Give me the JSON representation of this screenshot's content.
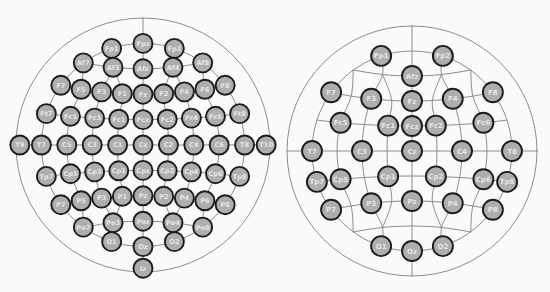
{
  "figure": {
    "background": "#fafaf9",
    "line_color": "#8c8c8c",
    "line_width": 1,
    "electrode_fill": "#aeaeae",
    "electrode_stroke": "#1c1c1c",
    "electrode_stroke_width": 1.9,
    "label_color": "#e6e6e6"
  },
  "positions": {
    "Fpz": [
      0,
      -0.8
    ],
    "Fp1": [
      -0.247,
      -0.761
    ],
    "Fp2": [
      0.247,
      -0.761
    ],
    "Af7": [
      -0.47,
      -0.647
    ],
    "Af3": [
      -0.236,
      -0.612
    ],
    "Afz": [
      0,
      -0.6
    ],
    "Af4": [
      0.236,
      -0.612
    ],
    "Af8": [
      0.47,
      -0.647
    ],
    "F7": [
      -0.647,
      -0.47
    ],
    "F5": [
      -0.487,
      -0.439
    ],
    "F3": [
      -0.326,
      -0.418
    ],
    "F1": [
      -0.163,
      -0.404
    ],
    "Fz": [
      0,
      -0.4
    ],
    "F2": [
      0.163,
      -0.404
    ],
    "F4": [
      0.326,
      -0.418
    ],
    "F6": [
      0.487,
      -0.439
    ],
    "F8": [
      0.647,
      -0.47
    ],
    "Ft7": [
      -0.761,
      -0.247
    ],
    "Fc5": [
      -0.571,
      -0.226
    ],
    "Fc3": [
      -0.381,
      -0.212
    ],
    "Fc1": [
      -0.191,
      -0.203
    ],
    "Fcz": [
      0,
      -0.2
    ],
    "Fc2": [
      0.191,
      -0.203
    ],
    "Fc4": [
      0.381,
      -0.212
    ],
    "Fc6": [
      0.571,
      -0.226
    ],
    "Ft8": [
      0.761,
      -0.247
    ],
    "T9": [
      -0.97,
      0
    ],
    "T7": [
      -0.8,
      0
    ],
    "C5": [
      -0.6,
      0
    ],
    "C3": [
      -0.4,
      0
    ],
    "C1": [
      -0.2,
      0
    ],
    "Cz": [
      0,
      0
    ],
    "C2": [
      0.2,
      0
    ],
    "C4": [
      0.4,
      0
    ],
    "C6": [
      0.6,
      0
    ],
    "T8": [
      0.8,
      0
    ],
    "T10": [
      0.97,
      0
    ],
    "Tp7": [
      -0.761,
      0.247
    ],
    "Cp5": [
      -0.571,
      0.226
    ],
    "Cp3": [
      -0.381,
      0.212
    ],
    "Cp1": [
      -0.191,
      0.203
    ],
    "Cpz": [
      0,
      0.2
    ],
    "Cp2": [
      0.191,
      0.203
    ],
    "Cp4": [
      0.381,
      0.212
    ],
    "Cp6": [
      0.571,
      0.226
    ],
    "Tp8": [
      0.761,
      0.247
    ],
    "P7": [
      -0.647,
      0.47
    ],
    "P5": [
      -0.487,
      0.439
    ],
    "P3": [
      -0.326,
      0.418
    ],
    "P1": [
      -0.163,
      0.404
    ],
    "Pz": [
      0,
      0.4
    ],
    "P2": [
      0.163,
      0.404
    ],
    "P4": [
      0.326,
      0.418
    ],
    "P6": [
      0.487,
      0.439
    ],
    "P8": [
      0.647,
      0.47
    ],
    "Po7": [
      -0.47,
      0.647
    ],
    "Po3": [
      -0.236,
      0.612
    ],
    "Poz": [
      0,
      0.6
    ],
    "Po4": [
      0.236,
      0.612
    ],
    "Po8": [
      0.47,
      0.647
    ],
    "O1": [
      -0.247,
      0.761
    ],
    "Oz": [
      0,
      0.8
    ],
    "O2": [
      0.247,
      0.761
    ],
    "Iz": [
      0,
      0.97
    ]
  },
  "mesh_chains": {
    "rows": [
      [
        "Af7",
        "Af3",
        "Afz",
        "Af4",
        "Af8"
      ],
      [
        "F7",
        "F5",
        "F3",
        "F1",
        "Fz",
        "F2",
        "F4",
        "F6",
        "F8"
      ],
      [
        "Ft7",
        "Fc5",
        "Fc3",
        "Fc1",
        "Fcz",
        "Fc2",
        "Fc4",
        "Fc6",
        "Ft8"
      ],
      [
        "Tp7",
        "Cp5",
        "Cp3",
        "Cp1",
        "Cpz",
        "Cp2",
        "Cp4",
        "Cp6",
        "Tp8"
      ],
      [
        "P7",
        "P5",
        "P3",
        "P1",
        "Pz",
        "P2",
        "P4",
        "P6",
        "P8"
      ],
      [
        "Po7",
        "Po3",
        "Poz",
        "Po4",
        "Po8"
      ]
    ],
    "columns": [
      [
        "Af7",
        "F5",
        "Fc5",
        "C5",
        "Cp5",
        "P5",
        "Po7"
      ],
      [
        "Fp1",
        "Af3",
        "F3",
        "Fc3",
        "C3",
        "Cp3",
        "P3",
        "Po3",
        "O1"
      ],
      [
        "Af3",
        "F1",
        "Fc1",
        "C1",
        "Cp1",
        "P1",
        "Po3"
      ],
      [
        "Af8",
        "F6",
        "Fc6",
        "C6",
        "Cp6",
        "P6",
        "Po8"
      ],
      [
        "Fp2",
        "Af4",
        "F4",
        "Fc4",
        "C4",
        "Cp4",
        "P4",
        "Po4",
        "O2"
      ],
      [
        "Af4",
        "F2",
        "Fc2",
        "C2",
        "Cp2",
        "P2",
        "Po4"
      ]
    ]
  },
  "heads": [
    {
      "id": "left",
      "cx": 143,
      "cy": 145,
      "radius": 127,
      "inner_ratio": 0.8,
      "electrode_radius": 9.5,
      "label_size": 6.6,
      "electrodes": [
        "Fp1",
        "Fpz",
        "Fp2",
        "Af7",
        "Af3",
        "Afz",
        "Af4",
        "Af8",
        "F7",
        "F5",
        "F3",
        "F1",
        "Fz",
        "F2",
        "F4",
        "F6",
        "F8",
        "Ft7",
        "Fc5",
        "Fc3",
        "Fc1",
        "Fcz",
        "Fc2",
        "Fc4",
        "Fc6",
        "Ft8",
        "T9",
        "T7",
        "C5",
        "C3",
        "C1",
        "Cz",
        "C2",
        "C4",
        "C6",
        "T8",
        "T10",
        "Tp7",
        "Cp5",
        "Cp3",
        "Cp1",
        "Cpz",
        "Cp2",
        "Cp4",
        "Cp6",
        "Tp8",
        "P7",
        "P5",
        "P3",
        "P1",
        "Pz",
        "P2",
        "P4",
        "P6",
        "P8",
        "Po7",
        "Po3",
        "Poz",
        "Po4",
        "Po8",
        "O1",
        "Oz",
        "O2",
        "Iz"
      ]
    },
    {
      "id": "right",
      "cx": 412,
      "cy": 151,
      "radius": 125,
      "inner_ratio": 0.8,
      "electrode_radius": 10,
      "label_size": 7,
      "electrodes": [
        "Fp1",
        "Fp2",
        "Afz",
        "F7",
        "F3",
        "Fz",
        "F4",
        "F8",
        "Fc5",
        "Fc1",
        "Fcz",
        "Fc2",
        "Fc6",
        "T7",
        "C3",
        "Cz",
        "C4",
        "T8",
        "Tp7",
        "Cp5",
        "Cp1",
        "Cp2",
        "Cp6",
        "Tp8",
        "P7",
        "P3",
        "Pz",
        "P4",
        "P8",
        "O1",
        "Oz",
        "O2"
      ]
    }
  ]
}
